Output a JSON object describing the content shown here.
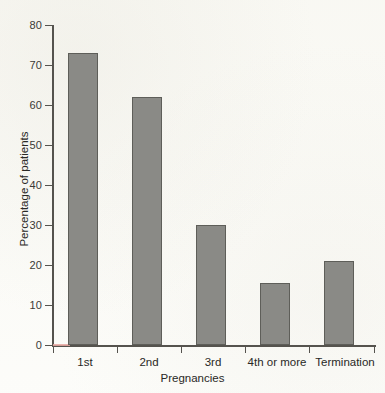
{
  "figure": {
    "background_color": "#fcfcf9",
    "bar_fill_color": "#8a8a86",
    "bar_edge_color": "#5e5e59",
    "axis_color": "#55534e",
    "baseline_accent_color": "#e8a8a2"
  },
  "chart_data": {
    "type": "bar",
    "title": "",
    "subtitle": "",
    "xlabel": "Pregnancies",
    "ylabel": "Percentage of patients",
    "categories": [
      "1st",
      "2nd",
      "3rd",
      "4th or more",
      "Termination"
    ],
    "values": [
      73,
      62,
      30,
      15.5,
      21
    ],
    "series": [
      {
        "name": "Percentage of patients",
        "values": [
          73,
          62,
          30,
          15.5,
          21
        ]
      }
    ],
    "ylim": [
      0,
      80
    ],
    "xlim": [
      0,
      5
    ],
    "ytick_labels": [
      "0",
      "10",
      "20",
      "30",
      "40",
      "50",
      "60",
      "70",
      "80"
    ],
    "ytick_values": [
      0,
      10,
      20,
      30,
      40,
      50,
      60,
      70,
      80
    ],
    "xtick_labels": [
      "1st",
      "2nd",
      "3rd",
      "4th or more",
      "Termination"
    ],
    "grid": false,
    "legend": false,
    "legend_position": "none",
    "annotations": []
  }
}
